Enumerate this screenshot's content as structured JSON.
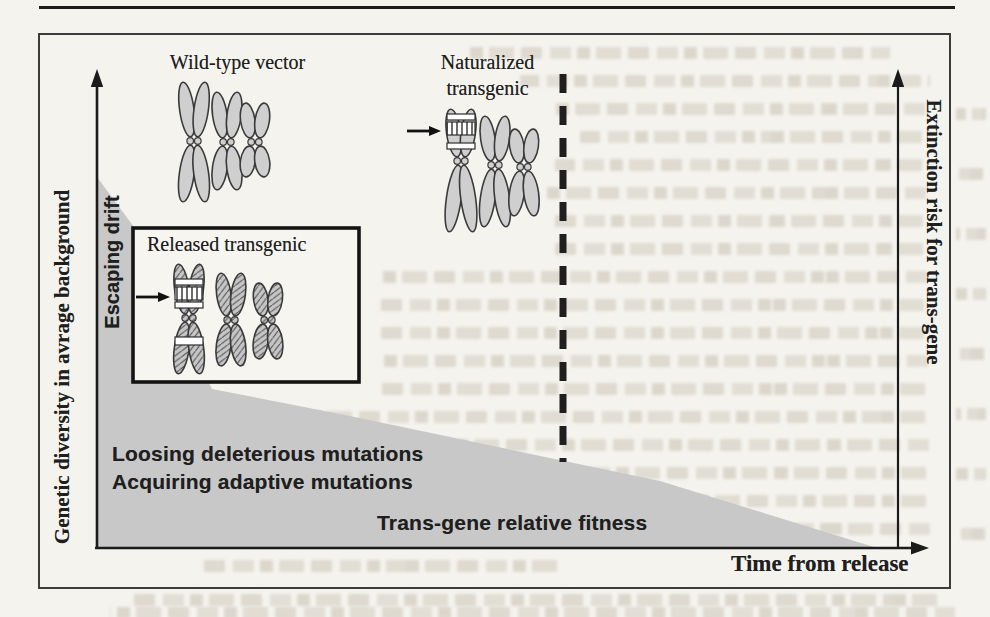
{
  "figure": {
    "groups": {
      "wild_type_label": "Wild-type vector",
      "naturalized_label_line1": "Naturalized",
      "naturalized_label_line2": "transgenic",
      "released_label": "Released transgenic"
    },
    "annotations": {
      "escaping_drift": "Escaping drift",
      "loosing_mutations": "Loosing deleterious mutations",
      "acquiring_mutations": "Acquiring adaptive mutations",
      "transgene_fitness": "Trans-gene relative fitness"
    },
    "axes": {
      "y_axis_label": "Genetic diversity in avrage background",
      "x_axis_label": "Time from release",
      "right_axis_label": "Extinction risk for trans-gene"
    },
    "icons": {
      "y_axis_arrow": "up-arrow",
      "x_axis_arrow": "right-arrow",
      "extinction_axis_arrow": "up-arrow",
      "released_arrow": "right-arrow",
      "naturalized_arrow": "right-arrow"
    },
    "colors": {
      "ink": "#1e1e1e",
      "shade_gray": "#c8c8c8",
      "chromosome_plain_fill": "#cfcfcf",
      "chromosome_hatch_base": "#c6c6c6",
      "paper": "#f5f3ee"
    }
  }
}
